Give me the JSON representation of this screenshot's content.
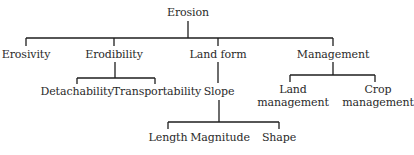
{
  "diagram": {
    "type": "tree",
    "root": "Erosion",
    "line_color": "#1e1e1e",
    "nodes": {
      "erosion": "Erosion",
      "erosivity": "Erosivity",
      "erodibility": "Erodibility",
      "land_form": "Land form",
      "management": "Management",
      "detachability": "Detachability",
      "transportability": "Transportability",
      "slope": "Slope",
      "land_management": [
        "Land",
        "management"
      ],
      "crop_management": [
        "Crop",
        "management"
      ],
      "length": "Length",
      "magnitude": "Magnitude",
      "shape": "Shape"
    },
    "edges": [
      [
        "Erosion",
        "Erosivity"
      ],
      [
        "Erosion",
        "Erodibility"
      ],
      [
        "Erosion",
        "Land form"
      ],
      [
        "Erosion",
        "Management"
      ],
      [
        "Erodibility",
        "Detachability"
      ],
      [
        "Erodibility",
        "Transportability"
      ],
      [
        "Land form",
        "Slope"
      ],
      [
        "Slope",
        "Length"
      ],
      [
        "Slope",
        "Magnitude"
      ],
      [
        "Slope",
        "Shape"
      ],
      [
        "Management",
        "Land management"
      ],
      [
        "Management",
        "Crop management"
      ]
    ]
  }
}
